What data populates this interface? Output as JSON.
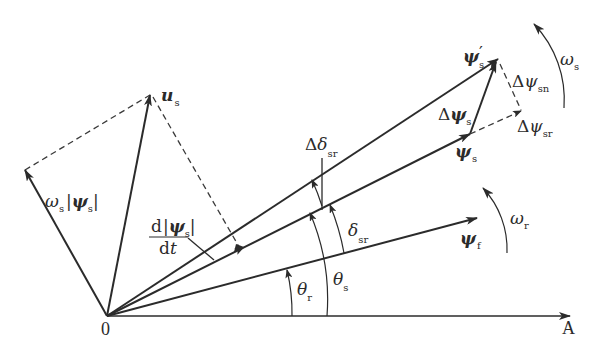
{
  "diagram": {
    "origin_label": "0",
    "axis_label": "A",
    "vectors": {
      "u_s": {
        "symbol": "u",
        "sub": "s"
      },
      "omega_s_psi_s": {
        "symbol": "ω",
        "sub": "s",
        "bar_symbol": "ψ",
        "bar_sub": "s"
      },
      "psi_s_prime": {
        "symbol": "ψ",
        "prime": "′",
        "sub": "s"
      },
      "psi_s": {
        "symbol": "ψ",
        "sub": "s"
      },
      "psi_f": {
        "symbol": "ψ",
        "sub": "f"
      },
      "delta_psi_s": {
        "prefix": "Δ",
        "symbol": "ψ",
        "sub": "s"
      },
      "delta_psi_sn": {
        "prefix": "Δ",
        "symbol": "ψ",
        "sub": "sn"
      },
      "delta_psi_sr": {
        "prefix": "Δ",
        "symbol": "ψ",
        "sub": "sr"
      }
    },
    "angles": {
      "theta_r": {
        "symbol": "θ",
        "sub": "r"
      },
      "theta_s": {
        "symbol": "θ",
        "sub": "s"
      },
      "delta_sr": {
        "symbol": "δ",
        "sub": "sr"
      },
      "delta_delta_sr": {
        "prefix": "Δ",
        "symbol": "δ",
        "sub": "sr"
      }
    },
    "rotations": {
      "omega_s": {
        "symbol": "ω",
        "sub": "s"
      },
      "omega_r": {
        "symbol": "ω",
        "sub": "r"
      }
    },
    "derivative": {
      "numerator_d": "d",
      "numerator_symbol": "ψ",
      "numerator_sub": "s",
      "denominator": "d",
      "denominator_var": "t"
    }
  }
}
